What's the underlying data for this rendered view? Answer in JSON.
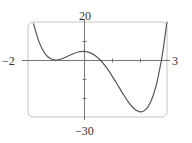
{
  "chart_data": {
    "type": "line",
    "title": "",
    "xlabel": "",
    "ylabel": "",
    "xlim": [
      -2,
      3
    ],
    "ylim": [
      -30,
      20
    ],
    "grid": false,
    "legend": null,
    "tick_labels": {
      "x_min": "−2",
      "x_max": "3",
      "y_max": "20",
      "y_min": "−30"
    },
    "x_ticks": [
      1,
      2
    ],
    "y_ticks": [
      10,
      -10,
      -20
    ],
    "series": [
      {
        "name": "f(x)",
        "x": [
          -1.8,
          -1.6,
          -1.4,
          -1.2,
          -1.0,
          -0.8,
          -0.5,
          -0.2,
          0.0,
          0.2,
          0.4,
          0.6,
          0.8,
          1.0,
          1.2,
          1.4,
          1.6,
          1.8,
          2.0,
          2.2,
          2.4,
          2.6,
          2.8,
          2.9,
          2.95,
          3.0
        ],
        "y": [
          19.1,
          9.4,
          3.6,
          0.8,
          0.0,
          0.5,
          2.5,
          4.2,
          4.5,
          4.0,
          2.5,
          0.0,
          -3.5,
          -7.8,
          -12.5,
          -17.4,
          -21.9,
          -25.4,
          -27.2,
          -26.5,
          -22.5,
          -14.0,
          0.0,
          9.5,
          14.9,
          20.0
        ]
      }
    ],
    "annotations": {
      "local_min": {
        "x": -1,
        "y": 0
      },
      "local_max": {
        "x": 0,
        "y": 4.5
      },
      "global_min": {
        "x": 2.05,
        "y": -27.2
      },
      "roots": [
        -1,
        0.6,
        2.8
      ]
    },
    "colors": {
      "curve": "#555555",
      "axes": "#777777",
      "frame": "#bbbbbb"
    }
  },
  "labels": {
    "y_max": "20",
    "y_min": "−30",
    "x_min": "−2",
    "x_max": "3"
  }
}
